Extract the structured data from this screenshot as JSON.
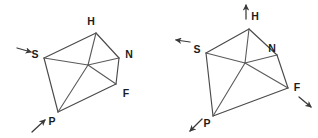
{
  "figure": {
    "background_color": "#ffffff",
    "line_color": "#4a4a4a",
    "label_color": "#1c1c1c",
    "diagrams": [
      {
        "id": "left-diagram",
        "name": "left-pentagon-diagram",
        "hub": {
          "x": 88,
          "y": 65,
          "label": ""
        },
        "vertices": [
          {
            "key": "H",
            "label": "H",
            "x": 96,
            "y": 33,
            "label_x": 91,
            "label_y": 22,
            "anchor": "middle"
          },
          {
            "key": "N",
            "label": "N",
            "x": 119,
            "y": 58,
            "label_x": 129,
            "label_y": 55,
            "anchor": "middle"
          },
          {
            "key": "F",
            "label": "F",
            "x": 116,
            "y": 84,
            "label_x": 126,
            "label_y": 94,
            "anchor": "middle"
          },
          {
            "key": "P",
            "label": "P",
            "x": 58,
            "y": 112,
            "label_x": 52,
            "label_y": 122,
            "anchor": "middle"
          },
          {
            "key": "S",
            "label": "S",
            "x": 44,
            "y": 58,
            "label_x": 35,
            "label_y": 55,
            "anchor": "middle"
          }
        ],
        "perimeter_order": [
          "H",
          "N",
          "F",
          "P",
          "S"
        ],
        "spokes": [
          "H",
          "N",
          "F",
          "P",
          "S"
        ],
        "arrows": [
          {
            "key": "arrow-S",
            "at": "S",
            "label": "",
            "from_x": 17,
            "from_y": 48,
            "to_x": 31,
            "to_y": 52,
            "direction": "right"
          },
          {
            "key": "arrow-P",
            "at": "P",
            "label": "",
            "from_x": 32,
            "from_y": 132,
            "to_x": 45,
            "to_y": 120,
            "direction": "up-right"
          }
        ]
      },
      {
        "id": "right-diagram",
        "name": "right-pentagon-diagram",
        "hub": {
          "x": 245,
          "y": 63,
          "label": ""
        },
        "vertices": [
          {
            "key": "H",
            "label": "H",
            "x": 249,
            "y": 29,
            "label_x": 255,
            "label_y": 17,
            "anchor": "middle"
          },
          {
            "key": "N",
            "label": "N",
            "x": 277,
            "y": 55,
            "label_x": 272,
            "label_y": 49,
            "anchor": "middle"
          },
          {
            "key": "F",
            "label": "F",
            "x": 288,
            "y": 88,
            "label_x": 297,
            "label_y": 88,
            "anchor": "middle"
          },
          {
            "key": "P",
            "label": "P",
            "x": 213,
            "y": 116,
            "label_x": 207,
            "label_y": 124,
            "anchor": "middle"
          },
          {
            "key": "S",
            "label": "S",
            "x": 206,
            "y": 53,
            "label_x": 197,
            "label_y": 50,
            "anchor": "middle"
          }
        ],
        "perimeter_order": [
          "H",
          "N",
          "F",
          "P",
          "S"
        ],
        "spokes": [
          "H",
          "N",
          "F",
          "P",
          "S"
        ],
        "arrows": [
          {
            "key": "arrow-H",
            "at": "H",
            "label": "",
            "from_x": 246,
            "from_y": 19,
            "to_x": 246,
            "to_y": 5,
            "direction": "up"
          },
          {
            "key": "arrow-S",
            "at": "S",
            "label": "",
            "from_x": 190,
            "from_y": 42,
            "to_x": 176,
            "to_y": 40,
            "direction": "left"
          },
          {
            "key": "arrow-F",
            "at": "F",
            "label": "",
            "from_x": 299,
            "from_y": 97,
            "to_x": 311,
            "to_y": 107,
            "direction": "down-right"
          },
          {
            "key": "arrow-P",
            "at": "P",
            "label": "",
            "from_x": 202,
            "from_y": 119,
            "to_x": 190,
            "to_y": 131,
            "direction": "down-left"
          }
        ]
      }
    ]
  }
}
